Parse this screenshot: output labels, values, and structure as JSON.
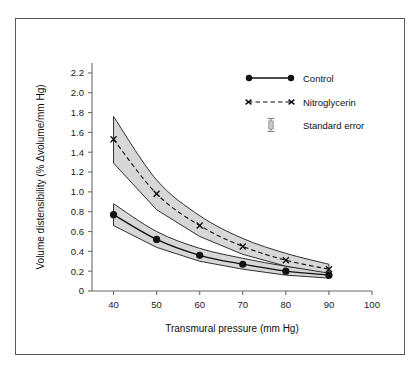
{
  "chart_data": {
    "type": "line",
    "title": "",
    "xlabel": "Transmural pressure (mm Hg)",
    "ylabel": "Volume distensibility (% Δvolume/mm Hg)",
    "x": [
      40,
      50,
      60,
      70,
      80,
      90
    ],
    "xlim": [
      35,
      100
    ],
    "ylim": [
      0,
      2.3
    ],
    "xticks": [
      40,
      50,
      60,
      70,
      80,
      90,
      100
    ],
    "xticklabels": [
      "40",
      "50",
      "60",
      "70",
      "80",
      "90",
      "100"
    ],
    "yticks": [
      0,
      0.2,
      0.4,
      0.6,
      0.8,
      1.0,
      1.2,
      1.4,
      1.6,
      1.8,
      2.0,
      2.2
    ],
    "yticklabels": [
      "0",
      "0.2",
      "0.4",
      "0.6",
      "0.8",
      "1.0",
      "1.2",
      "1.4",
      "1.6",
      "1.8",
      "2.0",
      "2.2"
    ],
    "grid": false,
    "legend_position": "top-right",
    "series": [
      {
        "name": "Control",
        "marker": "circle",
        "linestyle": "solid",
        "values": [
          0.77,
          0.52,
          0.36,
          0.27,
          0.2,
          0.16
        ],
        "upper": [
          0.88,
          0.6,
          0.43,
          0.33,
          0.25,
          0.2
        ],
        "lower": [
          0.66,
          0.44,
          0.3,
          0.22,
          0.16,
          0.13
        ]
      },
      {
        "name": "Nitroglycerin",
        "marker": "x",
        "linestyle": "dashed",
        "values": [
          1.53,
          0.98,
          0.66,
          0.45,
          0.31,
          0.22
        ],
        "upper": [
          1.76,
          1.12,
          0.76,
          0.53,
          0.38,
          0.27
        ],
        "lower": [
          1.29,
          0.82,
          0.55,
          0.37,
          0.25,
          0.18
        ]
      }
    ],
    "band_label": "Standard error",
    "band_color": "#d7d7d7"
  },
  "legend": {
    "items": [
      {
        "label": "Control",
        "marker": "circle",
        "linestyle": "solid"
      },
      {
        "label": "Nitroglycerin",
        "marker": "x",
        "linestyle": "dashed"
      },
      {
        "label": "Standard error",
        "marker": "errorbar",
        "linestyle": "none"
      }
    ]
  },
  "axes": {
    "x_title": "Transmural pressure (mm Hg)",
    "y_title": "Volume distensibility (% Δvolume/mm Hg)"
  },
  "colors": {
    "line": "#111111",
    "band": "#d7d7d7",
    "axis": "#6b6b6b",
    "frame": "#5a5a5a",
    "background": "#ffffff"
  }
}
